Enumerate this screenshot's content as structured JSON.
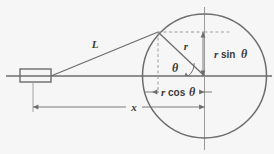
{
  "figure": {
    "background_color": "#f6f6f6",
    "stroke_color": "#6d6d6d",
    "text_color": "#3a3a3a",
    "dash_color": "#9a9a9a"
  },
  "labels": {
    "L": "L",
    "r": "r",
    "theta": "θ",
    "x": "x",
    "r_sin_theta_prefix": "r",
    "r_sin_theta_fn": "sin",
    "r_sin_theta_angle": "θ",
    "r_cos_theta_prefix": "r",
    "r_cos_theta_fn": "cos",
    "r_cos_theta_angle": "θ",
    "r_sin_theta_full": "r sin θ",
    "r_cos_theta_full": "r cos θ"
  },
  "geometry": {
    "circle": {
      "cx": 204.5,
      "cy": 76,
      "r": 62
    },
    "contact_point": {
      "x": 158,
      "y": 32
    },
    "rect": {
      "x": 20,
      "y": 69,
      "w": 31,
      "h": 13
    },
    "axis_y": 76,
    "x_dimension": {
      "from": 33,
      "to": 204.5,
      "y": 107
    },
    "rcos_dimension": {
      "from": 152,
      "to": 204.5,
      "y": 92
    },
    "rsin_dimension": {
      "x": 203,
      "from": 32,
      "to": 76
    }
  },
  "elements": {
    "circle_name": "circle-outline",
    "horizontal_axis_name": "horizontal-axis-line",
    "vertical_axis_name": "vertical-axis-line",
    "tangent_name": "tangent-line-L",
    "radius_name": "radius-line-r",
    "rect_name": "observer-rectangle",
    "angle_arc_name": "angle-arc-theta"
  }
}
